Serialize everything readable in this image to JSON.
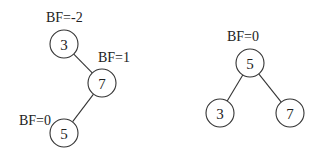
{
  "diagram": {
    "type": "avl-tree-rotation",
    "trees": [
      {
        "name": "unbalanced",
        "nodes": [
          {
            "id": "L3",
            "value": "3",
            "cx": 64,
            "cy": 44,
            "bf_label": "BF=-2",
            "bf_x": 46,
            "bf_y": 22
          },
          {
            "id": "L7",
            "value": "7",
            "cx": 102,
            "cy": 83,
            "bf_label": "BF=1",
            "bf_x": 98,
            "bf_y": 62
          },
          {
            "id": "L5",
            "value": "5",
            "cx": 64,
            "cy": 133,
            "bf_label": "BF=0",
            "bf_x": 19,
            "bf_y": 125
          }
        ],
        "edges": [
          [
            "L3",
            "L7"
          ],
          [
            "L7",
            "L5"
          ]
        ]
      },
      {
        "name": "balanced",
        "nodes": [
          {
            "id": "R5",
            "value": "5",
            "cx": 250,
            "cy": 63,
            "bf_label": "BF=0",
            "bf_x": 227,
            "bf_y": 41
          },
          {
            "id": "R3",
            "value": "3",
            "cx": 220,
            "cy": 113,
            "bf_label": "",
            "bf_x": 0,
            "bf_y": 0
          },
          {
            "id": "R7",
            "value": "7",
            "cx": 290,
            "cy": 113,
            "bf_label": "",
            "bf_x": 0,
            "bf_y": 0
          }
        ],
        "edges": [
          [
            "R5",
            "R3"
          ],
          [
            "R5",
            "R7"
          ]
        ]
      }
    ],
    "node_radius": 14,
    "colors": {
      "stroke": "#333333",
      "text": "#222222",
      "background": "#ffffff"
    }
  }
}
